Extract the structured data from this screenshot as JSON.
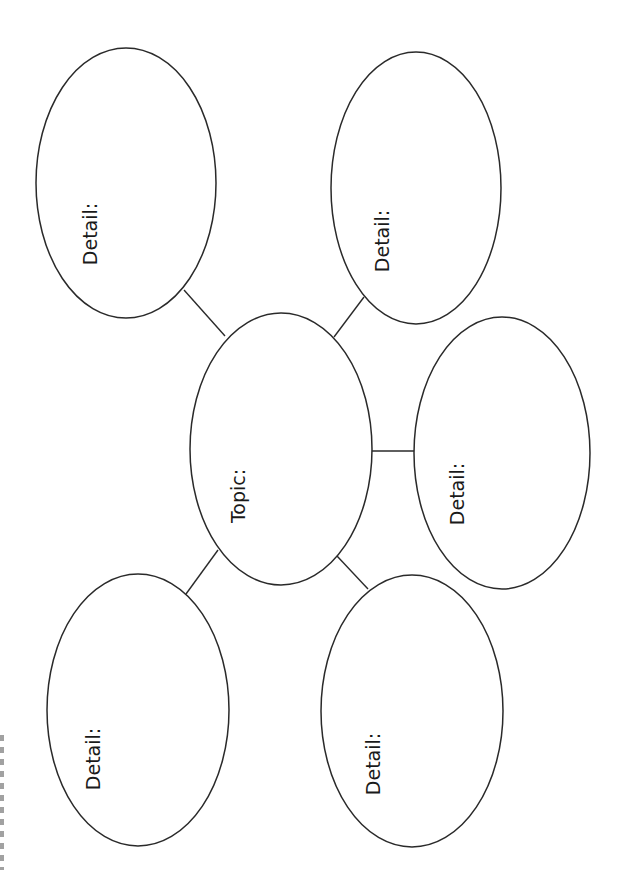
{
  "diagram": {
    "type": "web organizer",
    "orientation": "rotated 90deg counter-clockwise",
    "colors": {
      "stroke": "#2a2a2a",
      "text": "#1a1a1a",
      "background": "#ffffff"
    },
    "center": {
      "label": "Topic:"
    },
    "details": [
      {
        "position": "top-left",
        "label": "Detail:"
      },
      {
        "position": "top-right",
        "label": "Detail:"
      },
      {
        "position": "right",
        "label": "Detail:"
      },
      {
        "position": "bottom-left",
        "label": "Detail:"
      },
      {
        "position": "bottom-middle",
        "label": "Detail:"
      }
    ]
  }
}
